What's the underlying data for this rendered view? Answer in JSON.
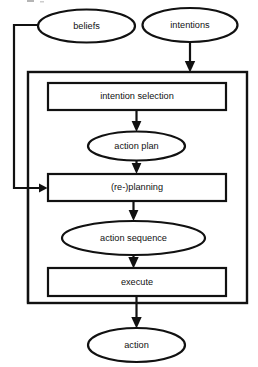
{
  "diagram": {
    "type": "flowchart",
    "background_color": "#ffffff",
    "line_color": "#111111",
    "nodes": [
      {
        "id": "beliefs",
        "label": "beliefs",
        "shape": "ellipse",
        "cx": 86.5,
        "cy": 26,
        "rx": 48.5,
        "ry": 16.5
      },
      {
        "id": "intentions",
        "label": "intentions",
        "shape": "ellipse",
        "cx": 190,
        "cy": 25,
        "rx": 47.5,
        "ry": 17
      },
      {
        "id": "intention-selection",
        "label": "intention selection",
        "shape": "rectangle",
        "x": 48,
        "y": 83,
        "w": 178,
        "h": 27
      },
      {
        "id": "action-plan",
        "label": "action plan",
        "shape": "ellipse",
        "cx": 136.5,
        "cy": 146,
        "rx": 48.5,
        "ry": 14.5
      },
      {
        "id": "re-planning",
        "label": "(re-)planning",
        "shape": "rectangle",
        "x": 48,
        "y": 174,
        "w": 178,
        "h": 27
      },
      {
        "id": "action-sequence",
        "label": "action sequence",
        "shape": "ellipse",
        "cx": 133.5,
        "cy": 238,
        "rx": 71.5,
        "ry": 17
      },
      {
        "id": "execute",
        "label": "execute",
        "shape": "rectangle",
        "x": 48,
        "y": 268,
        "w": 178,
        "h": 28
      },
      {
        "id": "action",
        "label": "action",
        "shape": "ellipse",
        "cx": 136.5,
        "cy": 345,
        "rx": 48.5,
        "ry": 17
      }
    ],
    "container": {
      "id": "cycle-container",
      "label": "",
      "x": 28,
      "y": 72,
      "w": 219,
      "h": 231
    },
    "edges": [
      {
        "id": "intentions-to-container",
        "from": "intentions",
        "to": "cycle-container",
        "arrow": true
      },
      {
        "id": "selection-to-plan",
        "from": "intention-selection",
        "to": "action-plan",
        "arrow": true
      },
      {
        "id": "plan-to-replanning",
        "from": "action-plan",
        "to": "re-planning",
        "arrow": true
      },
      {
        "id": "replanning-to-sequence",
        "from": "re-planning",
        "to": "action-sequence",
        "arrow": true
      },
      {
        "id": "sequence-to-execute",
        "from": "action-sequence",
        "to": "execute",
        "arrow": true
      },
      {
        "id": "execute-to-action",
        "from": "execute",
        "to": "action",
        "arrow": true
      },
      {
        "id": "beliefs-feedback",
        "from": "beliefs",
        "to": "re-planning",
        "arrow": true
      },
      {
        "id": "container-feedback",
        "from": "cycle-container",
        "to": "re-planning",
        "arrow": true
      }
    ]
  }
}
